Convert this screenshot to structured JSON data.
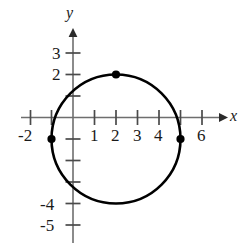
{
  "figure": {
    "kind": "coordinate-plane-with-circle",
    "background_color": "#ffffff",
    "ink_color": "#1a1a1a",
    "axis_color": "#6e6e6e",
    "curve_color": "#000000"
  },
  "axes": {
    "x_axis": {
      "name": "x",
      "arrow": "right",
      "tick_labels": [
        "-2",
        "1",
        "2",
        "3",
        "4",
        "6"
      ],
      "tick_values": [
        -2,
        1,
        2,
        3,
        4,
        6
      ],
      "all_tick_values": [
        -2,
        -1,
        1,
        2,
        3,
        4,
        5,
        6
      ],
      "range": [
        -2.4,
        6.9
      ]
    },
    "y_axis": {
      "name": "y",
      "arrow": "up",
      "tick_labels": [
        "3",
        "2",
        "-4",
        "-5"
      ],
      "tick_values": [
        3,
        2,
        -4,
        -5
      ],
      "all_tick_values": [
        3,
        2,
        1,
        -1,
        -2,
        -3,
        -4,
        -5
      ],
      "range": [
        -5.6,
        3.7
      ]
    },
    "origin_label": ""
  },
  "chart_data": {
    "type": "scatter",
    "title": "",
    "xlabel": "x",
    "ylabel": "y",
    "xlim": [
      -2.4,
      6.9
    ],
    "ylim": [
      -5.6,
      3.7
    ],
    "grid": false,
    "legend": "none",
    "curves": [
      {
        "name": "circle",
        "equation": "(x - 2)^2 + (y + 1)^2 = 9",
        "center": [
          2,
          -1
        ],
        "radius": 3,
        "stroke": "#000000",
        "stroke_width": 2.6
      }
    ],
    "points": [
      {
        "label": "top",
        "x": 2,
        "y": 2
      },
      {
        "label": "left",
        "x": -1,
        "y": -1
      },
      {
        "label": "right",
        "x": 5,
        "y": -1
      }
    ]
  }
}
